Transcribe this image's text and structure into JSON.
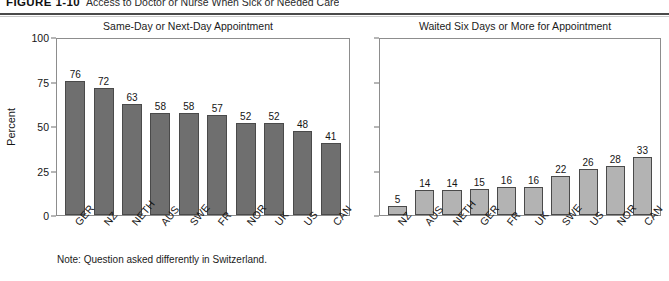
{
  "figure": {
    "number": "FIGURE 1-10",
    "title": "Access to Doctor or Nurse When Sick or Needed Care",
    "note": "Note: Question asked differently in Switzerland."
  },
  "axis": {
    "ylabel": "Percent",
    "yticks": [
      "0",
      "25",
      "50",
      "75",
      "100"
    ]
  },
  "chart_data": [
    {
      "type": "bar",
      "title": "Same-Day or Next-Day Appointment",
      "xlabel": "",
      "ylabel": "Percent",
      "ylim": [
        0,
        100
      ],
      "yticks": [
        0,
        25,
        50,
        75,
        100
      ],
      "grid": false,
      "legend": "none",
      "bar_color": "#6f6f6f",
      "categories": [
        "GER",
        "NZ",
        "NETH",
        "AUS",
        "SWE",
        "FR",
        "NOR",
        "UK",
        "US",
        "CAN"
      ],
      "values": [
        76,
        72,
        63,
        58,
        58,
        57,
        52,
        52,
        48,
        41
      ],
      "data_labels": [
        "76",
        "72",
        "63",
        "58",
        "58",
        "57",
        "52",
        "52",
        "48",
        "41"
      ]
    },
    {
      "type": "bar",
      "title": "Waited Six Days or More for Appointment",
      "xlabel": "",
      "ylabel": "",
      "ylim": [
        0,
        100
      ],
      "yticks": [
        0,
        25,
        50,
        75,
        100
      ],
      "grid": false,
      "legend": "none",
      "bar_color": "#b3b3b3",
      "categories": [
        "NZ",
        "AUS",
        "NETH",
        "GER",
        "FR",
        "UK",
        "SWE",
        "US",
        "NOR",
        "CAN"
      ],
      "values": [
        5,
        14,
        14,
        15,
        16,
        16,
        22,
        26,
        28,
        33
      ],
      "data_labels": [
        "5",
        "14",
        "14",
        "15",
        "16",
        "16",
        "22",
        "26",
        "28",
        "33"
      ]
    }
  ]
}
